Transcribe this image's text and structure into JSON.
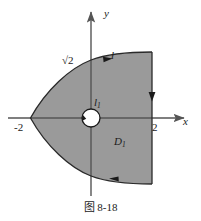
{
  "figure": {
    "caption": "图 8-18",
    "axes": {
      "x_label": "x",
      "y_label": "y",
      "x_tick_left": "-2",
      "x_tick_right": "2",
      "y_tick": "√2"
    },
    "labels": {
      "outer_curve": "l",
      "inner_circle_main": "l",
      "inner_circle_sub": "1",
      "region_main": "D",
      "region_sub": "1"
    },
    "colors": {
      "region_fill": "#9a9a9a",
      "stroke": "#2a2a2a",
      "axis": "#555555",
      "background": "#ffffff",
      "hole_fill": "#ffffff"
    },
    "geometry": {
      "origin_px": [
        91,
        118
      ],
      "unit_px_x": 30.5,
      "vertex_left_x": "-2",
      "right_boundary_x": "2",
      "curve_y_intercept": "√2",
      "hole_radius_px": 9
    },
    "orientation_arrows": [
      {
        "name": "top-curve-arrow",
        "direction": "right"
      },
      {
        "name": "right-edge-arrow",
        "direction": "down"
      },
      {
        "name": "bottom-curve-arrow",
        "direction": "left"
      },
      {
        "name": "hole-arrow",
        "direction": "counterclockwise"
      }
    ]
  }
}
